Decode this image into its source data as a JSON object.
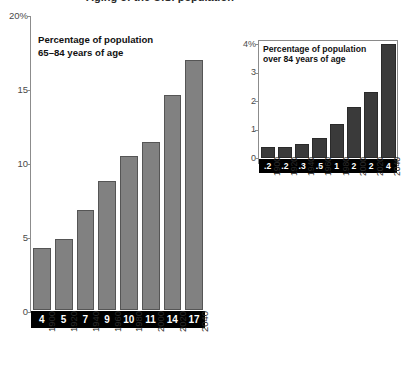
{
  "page": {
    "title_cutoff": "Aging of the U.S. population"
  },
  "chart_data": [
    {
      "type": "bar",
      "id": "population-65-84",
      "title": "Percentage of population\n65–84 years of age",
      "xlabel": "",
      "ylabel": "",
      "ylim": [
        0,
        20
      ],
      "grid": false,
      "legend": "none",
      "axis_tick_labels": [
        "20%",
        "15",
        "10",
        "5",
        "0"
      ],
      "axis_tick_values": [
        20,
        15,
        10,
        5,
        0
      ],
      "categories": [
        "1900",
        "1920",
        "1940",
        "1960",
        "1980",
        "2000",
        "2020",
        "2040"
      ],
      "values": [
        4.2,
        4.8,
        6.8,
        8.8,
        10.5,
        11.4,
        14.6,
        17.0
      ],
      "data_labels": [
        "4",
        "5",
        "7",
        "9",
        "10",
        "11",
        "14",
        "17"
      ],
      "bar_color": "#818181",
      "bar_edge_color": "#555555",
      "label_band_color": "#000000",
      "label_band_text_color": "#ffffff"
    },
    {
      "type": "bar",
      "id": "population-over-84",
      "title": "Percentage of population\nover 84 years of age",
      "xlabel": "",
      "ylabel": "",
      "ylim": [
        0,
        4
      ],
      "grid": false,
      "legend": "none",
      "axis_tick_labels": [
        "4%",
        "3",
        "2",
        "1",
        "0"
      ],
      "axis_tick_values": [
        4,
        3,
        2,
        1,
        0
      ],
      "categories": [
        "1900",
        "1920",
        "1940",
        "1960",
        "1980",
        "2000",
        "2020",
        "2040"
      ],
      "values": [
        0.4,
        0.4,
        0.5,
        0.7,
        1.2,
        1.8,
        2.3,
        4.0
      ],
      "data_labels": [
        ".2",
        ".2",
        ".3",
        ".5",
        "1",
        "2",
        "2",
        "4"
      ],
      "bar_color": "#3a3a3a",
      "bar_edge_color": "#2a2a2a",
      "label_band_color": "#000000",
      "label_band_text_color": "#ffffff"
    }
  ]
}
